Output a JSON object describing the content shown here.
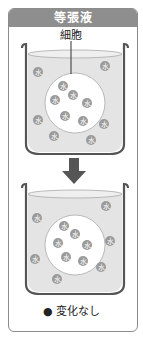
{
  "header": {
    "title": "等張液"
  },
  "labels": {
    "cell": "細胞",
    "caption": "● 変化なし"
  },
  "molecule_glyph": "水",
  "colors": {
    "header_bg": "#8e8e8e",
    "border": "#8c8c8c",
    "liquid": "#e4e4e4",
    "beaker_line": "#555555",
    "cell_fill": "#ffffff",
    "molecule": "#9a9a9a",
    "arrow": "#555555"
  },
  "beakers": [
    {
      "name": "before",
      "outside_molecules": [
        [
          38,
          72
        ],
        [
          105,
          66
        ],
        [
          38,
          120
        ],
        [
          54,
          136
        ],
        [
          104,
          124
        ],
        [
          91,
          140
        ]
      ],
      "inside_molecules": [
        [
          63,
          86
        ],
        [
          73,
          95
        ],
        [
          55,
          100
        ],
        [
          87,
          103
        ],
        [
          65,
          116
        ],
        [
          83,
          121
        ]
      ],
      "cell": {
        "cx": 75,
        "cy": 103,
        "r": 30
      }
    },
    {
      "name": "after",
      "outside_molecules": [
        [
          106,
          206
        ],
        [
          37,
          218
        ],
        [
          110,
          241
        ],
        [
          35,
          259
        ],
        [
          101,
          267
        ],
        [
          57,
          279
        ]
      ],
      "inside_molecules": [
        [
          64,
          226
        ],
        [
          75,
          234
        ],
        [
          58,
          243
        ],
        [
          87,
          245
        ],
        [
          66,
          257
        ],
        [
          83,
          261
        ]
      ],
      "cell": {
        "cx": 75,
        "cy": 245,
        "r": 30
      }
    }
  ]
}
